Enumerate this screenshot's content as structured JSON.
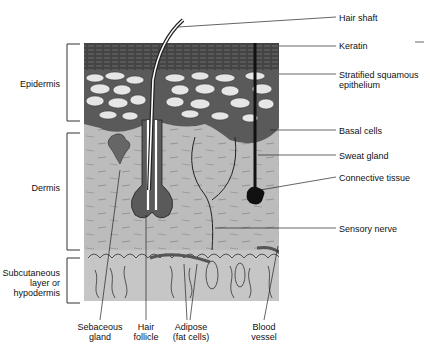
{
  "diagram": {
    "layers": [
      {
        "id": "epidermis",
        "label": "Epidermis"
      },
      {
        "id": "dermis",
        "label": "Dermis"
      },
      {
        "id": "hypodermis",
        "label": "Subcutaneous layer or hypodermis",
        "lines": [
          "Subcutaneous",
          "layer or",
          "hypodermis"
        ]
      }
    ],
    "right_labels": {
      "hair_shaft": "Hair shaft",
      "keratin": "Keratin",
      "stratified": [
        "Stratified squamous",
        "epithelium"
      ],
      "basal": "Basal cells",
      "sweat": "Sweat gland",
      "connective": "Connective tissue",
      "sensory": "Sensory nerve"
    },
    "bottom_labels": {
      "sebaceous": [
        "Sebaceous",
        "gland"
      ],
      "follicle": [
        "Hair",
        "follicle"
      ],
      "adipose": [
        "Adipose",
        "(fat cells)"
      ],
      "blood": [
        "Blood",
        "vessel"
      ]
    },
    "colors": {
      "keratin": "#3a3a3a",
      "epithelium_bg": "#5a5a5a",
      "cell": "#e6e6e6",
      "basal": "#4a4a4a",
      "dermis": "#b9b9b9",
      "hypodermis": "#c4c4c4",
      "line": "#222222"
    }
  }
}
